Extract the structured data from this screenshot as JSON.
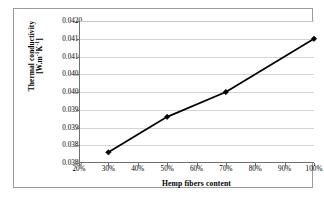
{
  "chart_data": {
    "type": "line",
    "title": "",
    "subtitle": "",
    "xlabel": "Hemp fibers content",
    "ylabel_line1": "Thermal conductivity",
    "ylabel_line2_prefix": "[W.m",
    "ylabel_line2_sup1": "-1",
    "ylabel_line2_mid": "K",
    "ylabel_line2_sup2": "-1",
    "ylabel_line2_suffix": "]",
    "ylabel": "Thermal conductivity [W.m-1K-1]",
    "x": [
      30,
      50,
      70,
      100
    ],
    "values": [
      0.0383,
      0.0393,
      0.04,
      0.0415
    ],
    "series": [
      {
        "name": "Thermal conductivity",
        "x": [
          30,
          50,
          70,
          100
        ],
        "values": [
          0.0383,
          0.0393,
          0.04,
          0.0415
        ]
      }
    ],
    "xlim": [
      20,
      100
    ],
    "ylim": [
      0.038,
      0.042
    ],
    "x_ticks": [
      20,
      30,
      40,
      50,
      60,
      70,
      80,
      90,
      100
    ],
    "x_tick_labels": [
      "20%",
      "30%",
      "40%",
      "50%",
      "60%",
      "70%",
      "80%",
      "90%",
      "100%"
    ],
    "y_ticks": [
      0.038,
      0.0385,
      0.039,
      0.0395,
      0.04,
      0.0405,
      0.041,
      0.0415,
      0.042
    ],
    "y_tick_labels": [
      "0.0380",
      "0.0385",
      "0.0390",
      "0.0395",
      "0.0400",
      "0.0405",
      "0.0410",
      "0.0415",
      "0.0420"
    ],
    "grid": "horizontal",
    "legend": "none",
    "line_color": "#000000",
    "marker": "diamond",
    "marker_color": "#000000",
    "grid_color": "#d4d4d4",
    "axis_color": "#6f6f6f",
    "plot_background": "#ffffff",
    "frame_color": "#9a9a9a"
  }
}
